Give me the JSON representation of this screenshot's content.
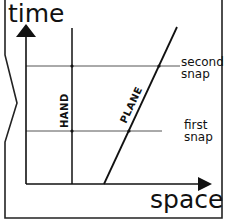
{
  "diagram": {
    "axes": {
      "y_label": "time",
      "x_label": "space"
    },
    "worldlines": [
      {
        "label": "HAND",
        "type": "vertical"
      },
      {
        "label": "PLANE",
        "type": "slanted"
      }
    ],
    "events": [
      {
        "label_line1": "second",
        "label_line2": "snap"
      },
      {
        "label_line1": "first",
        "label_line2": "snap"
      }
    ],
    "colors": {
      "ink": "#111111",
      "guide": "#555555",
      "background": "#ffffff"
    }
  }
}
